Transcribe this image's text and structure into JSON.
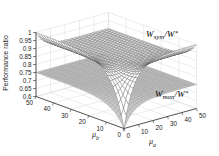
{
  "figure": {
    "zlabel": "Performance ratio",
    "xaxis_label": {
      "symbol": "μ",
      "sub": "a"
    },
    "yaxis_label": {
      "symbol": "μ",
      "sub": "b"
    },
    "surface_labels": {
      "sym": {
        "base": "W",
        "sub": "sym",
        "denom": "/W",
        "sup": "*"
      },
      "mon": {
        "base": "W",
        "sub": "mon",
        "denom": "/W",
        "sup": "*"
      }
    },
    "colors": {
      "background": "#ffffff",
      "grid": "#d6d6d6",
      "axis": "#2f2f2f",
      "tick_text": "#1c1c1c",
      "sym_mesh_line": "#4d4d4d",
      "sym_fill": "#ffffff",
      "mon_mesh_line": "#8a8a8a",
      "mon_fill": "#c9c9c9"
    }
  },
  "chart_data": {
    "type": "surface",
    "title": "",
    "xlabel": "μ_a",
    "ylabel": "μ_b",
    "zlabel": "Performance ratio",
    "x_range": [
      0,
      50
    ],
    "y_range": [
      0,
      50
    ],
    "z_range": [
      0.6,
      1.0
    ],
    "x_ticks": [
      "0",
      "10",
      "20",
      "30",
      "40",
      "50"
    ],
    "y_ticks": [
      "0",
      "10",
      "20",
      "30",
      "40",
      "50"
    ],
    "z_ticks": [
      "0.6",
      "0.65",
      "0.7",
      "0.75",
      "0.8",
      "0.85",
      "0.9",
      "0.95",
      "1"
    ],
    "grid": true,
    "view": "matlab-default-3d",
    "surfaces": [
      {
        "name": "W_mon/W*",
        "style": "gray-mesh",
        "z_at_origin": 0.6,
        "z_plateau": 0.75,
        "model": {
          "plateau": 0.75,
          "edge_ridge": 0.0,
          "ridge_scale": 1,
          "dip_depth": 0.15,
          "dip_scale": 7
        },
        "description": "Nearly flat plane at 0.75 dipping sharply to 0.6 at (0,0)"
      },
      {
        "name": "W_sym/W*",
        "style": "white-dense-mesh",
        "z_at_origin": 0.6,
        "z_plateau": 0.9,
        "z_edge_max": 1.0,
        "model": {
          "plateau": 0.9,
          "edge_ridge": 0.1,
          "ridge_scale": 5,
          "dip_depth": 0.4,
          "dip_scale": 7
        },
        "description": "Approaches 1 along the mu_a=0 and mu_b=0 edges, interior plateau near 0.9, deep funnel to 0.6 at (0,0)"
      }
    ]
  }
}
